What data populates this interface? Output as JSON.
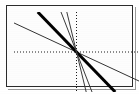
{
  "screen": {
    "label": "graphing-calculator-screen",
    "width": 139,
    "height": 94,
    "background_color": "#ffffff",
    "border_color": "#2b2b2b"
  },
  "chart_data": {
    "type": "line",
    "title": "",
    "subtitle": "",
    "xlabel": "",
    "ylabel": "",
    "xlim": [
      -10,
      10
    ],
    "ylim": [
      -6.2,
      6.2
    ],
    "grid": false,
    "axes": {
      "style": "dotted-tick-marks",
      "color": "#1a1a1a",
      "x_axis_at_y": 0,
      "y_axis_at_x": 0,
      "x_tick_step": 1,
      "y_tick_step": 1,
      "x_tick_labels": [],
      "y_tick_labels": []
    },
    "legend": {
      "visible": false,
      "position": "none",
      "entries": []
    },
    "annotations": [],
    "x": [
      -10,
      10
    ],
    "series": [
      {
        "name": "y = -0.45x",
        "slope": -0.45,
        "intercept": 0,
        "values": [
          4.5,
          -4.5
        ],
        "line_width": 1,
        "color": "#333333"
      },
      {
        "name": "y = -1x",
        "slope": -1.0,
        "intercept": 0,
        "values": [
          10,
          -10
        ],
        "line_width": 3,
        "color": "#000000"
      },
      {
        "name": "y = -2.5x",
        "slope": -2.5,
        "intercept": 0,
        "values": [
          25,
          -25
        ],
        "line_width": 1,
        "color": "#3a3a3a"
      },
      {
        "name": "y = -4x",
        "slope": -4.0,
        "intercept": 0,
        "values": [
          40,
          -40
        ],
        "line_width": 1,
        "color": "#3a3a3a"
      }
    ]
  }
}
